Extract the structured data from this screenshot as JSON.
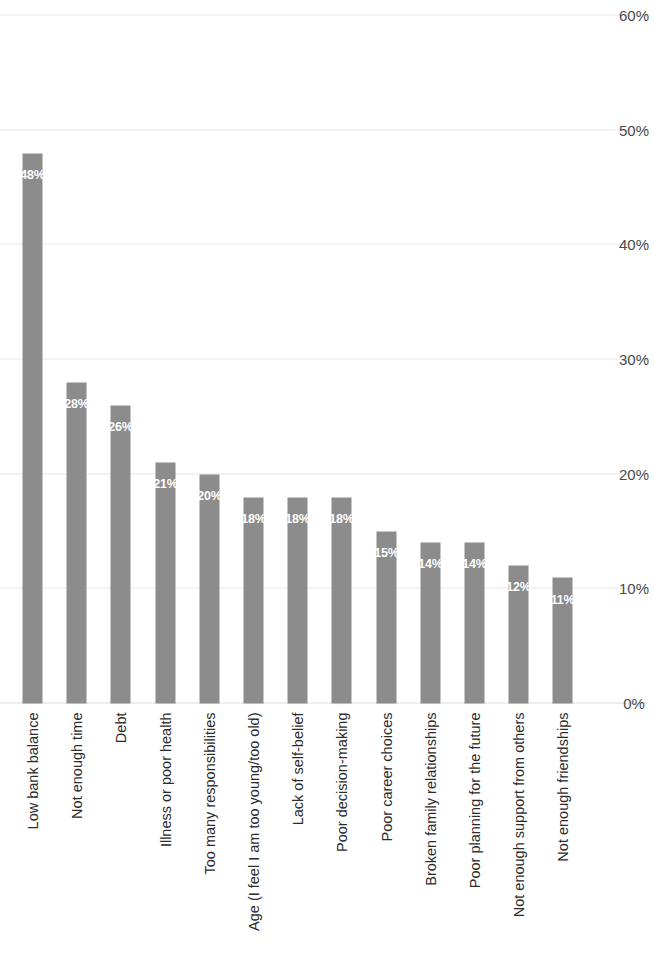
{
  "chart_data": {
    "type": "bar",
    "orientation": "horizontal",
    "title": "",
    "subtitle": "",
    "xlabel": "",
    "ylabel": "",
    "xlim": [
      0,
      60
    ],
    "grid": true,
    "legend": null,
    "tick_labels": [
      "0%",
      "10%",
      "20%",
      "30%",
      "40%",
      "50%",
      "60%"
    ],
    "tick_values": [
      0,
      10,
      20,
      30,
      40,
      50,
      60
    ],
    "categories": [
      "Low bank balance",
      "Not enough time",
      "Debt",
      "Illness or poor health",
      "Too many responsibilities",
      "Age (I feel I am too young/too old)",
      "Lack of self-belief",
      "Poor decision-making",
      "Poor career choices",
      "Broken family relationships",
      "Poor planning for the future",
      "Not enough support from others",
      "Not enough friendships"
    ],
    "values": [
      48,
      28,
      26,
      21,
      20,
      18,
      18,
      18,
      15,
      14,
      14,
      12,
      11
    ],
    "value_labels": [
      "48%",
      "28%",
      "26%",
      "21%",
      "20%",
      "18%",
      "18%",
      "18%",
      "15%",
      "14%",
      "14%",
      "12%",
      "11%"
    ],
    "bar_color": "#8c8c8c",
    "value_label_color": "#ffffff",
    "gridline_color": "#cfcfcf",
    "background_color": "#ffffff"
  }
}
